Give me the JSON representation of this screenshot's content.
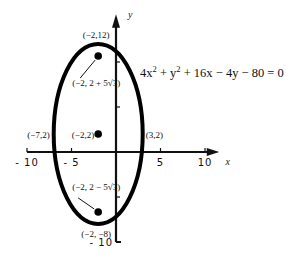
{
  "diagram": {
    "type": "ellipse-graph",
    "equation": {
      "parts": [
        "4x",
        "2",
        " + y",
        "2",
        " + 16x − 4y − 80 = 0"
      ],
      "full": "4x^2 + y^2 + 16x - 4y - 80 = 0"
    },
    "axes": {
      "x_label": "x",
      "y_label": "y",
      "x_ticks": [
        {
          "value": -10,
          "label": "-10"
        },
        {
          "value": -5,
          "label": "-5"
        },
        {
          "value": 5,
          "label": "5"
        },
        {
          "value": 10,
          "label": "10"
        }
      ],
      "y_ticks": [
        {
          "value": 10,
          "label": ""
        },
        {
          "value": 5,
          "label": ""
        },
        {
          "value": -5,
          "label": ""
        },
        {
          "value": -10,
          "label": "-10"
        }
      ],
      "x_range": [
        -10,
        11
      ],
      "y_range": [
        -10,
        15
      ]
    },
    "ellipse": {
      "center": [
        -2,
        2
      ],
      "semi_major_vertical": 10,
      "semi_minor_horizontal": 5
    },
    "points": [
      {
        "id": "center",
        "x": -2,
        "y": 2,
        "label": "(−2,2)",
        "dot": true
      },
      {
        "id": "focus-top",
        "x": -2,
        "y": 10.66,
        "label": "(−2, 2 + 5√3)",
        "dot": true
      },
      {
        "id": "focus-bottom",
        "x": -2,
        "y": -6.66,
        "label": "(−2, 2 − 5√3)",
        "dot": true
      },
      {
        "id": "vertex-top",
        "x": -2,
        "y": 12,
        "label": "(−2,12)",
        "dot": false
      },
      {
        "id": "vertex-bottom",
        "x": -2,
        "y": -8,
        "label": "(−2, −8)",
        "dot": false
      },
      {
        "id": "covertex-left",
        "x": -7,
        "y": 2,
        "label": "(−7,2)",
        "dot": false
      },
      {
        "id": "covertex-right",
        "x": 3,
        "y": 2,
        "label": "(3,2)",
        "dot": false
      }
    ]
  }
}
